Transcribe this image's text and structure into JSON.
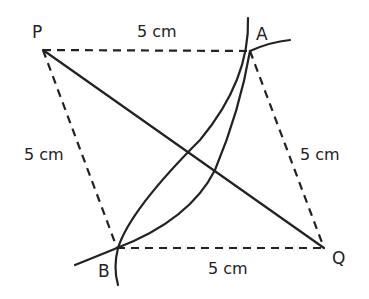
{
  "diagram": {
    "points": {
      "P": {
        "label": "P",
        "x": 43,
        "y": 50
      },
      "A": {
        "label": "A",
        "x": 250,
        "y": 51
      },
      "B": {
        "label": "B",
        "x": 117,
        "y": 248
      },
      "Q": {
        "label": "Q",
        "x": 324,
        "y": 248
      }
    },
    "sides": [
      {
        "from": "P",
        "to": "A",
        "style": "dashed",
        "label": "5 cm"
      },
      {
        "from": "P",
        "to": "B",
        "style": "dashed",
        "label": "5 cm"
      },
      {
        "from": "A",
        "to": "Q",
        "style": "dashed",
        "label": "5 cm"
      },
      {
        "from": "B",
        "to": "Q",
        "style": "dashed",
        "label": "5 cm"
      }
    ],
    "diagonal": {
      "from": "P",
      "to": "Q",
      "style": "solid"
    },
    "arcs": [
      {
        "name": "arc-centered-near-Q",
        "style": "solid"
      },
      {
        "name": "arc-centered-near-P",
        "style": "solid"
      }
    ],
    "labels": {
      "side_PA": "5 cm",
      "side_PB": "5 cm",
      "side_AQ": "5 cm",
      "side_BQ": "5 cm"
    },
    "colors": {
      "stroke": "#222222",
      "background": "#ffffff"
    }
  }
}
